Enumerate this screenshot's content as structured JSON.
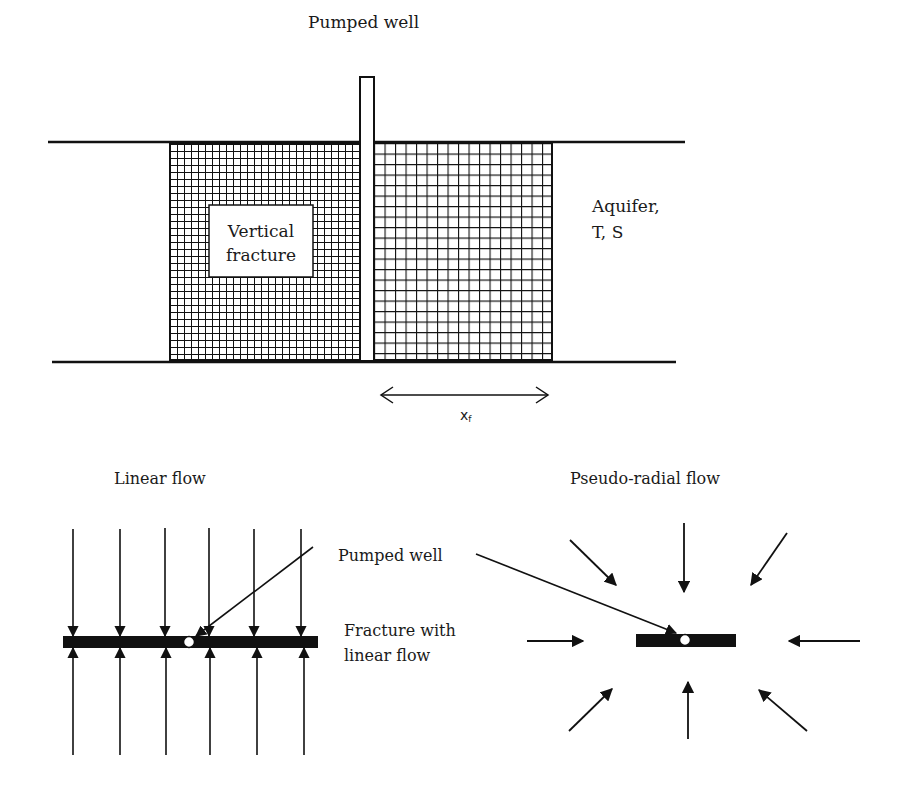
{
  "colors": {
    "ink": "#111111",
    "background": "#ffffff"
  },
  "top_panel": {
    "well_label": "Pumped well",
    "fracture_label_line1": "Vertical",
    "fracture_label_line2": "fracture",
    "aquifer_label_line1": "Aquifer,",
    "aquifer_label_line2": "T, S",
    "half_length_label": "x",
    "half_length_subscript": "f"
  },
  "bottom_left_panel": {
    "title": "Linear flow",
    "well_label": "Pumped well",
    "fracture_label_line1": "Fracture with",
    "fracture_label_line2": "linear flow",
    "arrow_columns": 6
  },
  "bottom_right_panel": {
    "title": "Pseudo-radial flow",
    "arrow_count": 8
  }
}
